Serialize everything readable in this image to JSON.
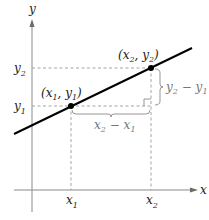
{
  "diagram": {
    "axes": {
      "x_label": "x",
      "y_label": "y",
      "axis_color": "#8a8a8a"
    },
    "points": [
      {
        "name": "point-1",
        "label_base_x": "x",
        "label_sub_x": "1",
        "label_base_y": "y",
        "label_sub_y": "1"
      },
      {
        "name": "point-2",
        "label_base_x": "x",
        "label_sub_x": "2",
        "label_base_y": "y",
        "label_sub_y": "2"
      }
    ],
    "ticks": {
      "x1": {
        "base": "x",
        "sub": "1"
      },
      "x2": {
        "base": "x",
        "sub": "2"
      },
      "y1": {
        "base": "y",
        "sub": "1"
      },
      "y2": {
        "base": "y",
        "sub": "2"
      }
    },
    "rise": {
      "a_base": "y",
      "a_sub": "2",
      "op": "−",
      "b_base": "y",
      "b_sub": "1"
    },
    "run": {
      "a_base": "x",
      "a_sub": "2",
      "op": "−",
      "b_base": "x",
      "b_sub": "1"
    },
    "colors": {
      "line": "#000000",
      "dashed": "#9a9a9a",
      "bracket": "#8a8a8a",
      "text": "#1a1a1a",
      "annotation_text": "#777777"
    }
  }
}
